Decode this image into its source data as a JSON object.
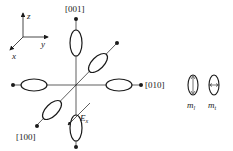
{
  "axes_glyph": {
    "z": "z",
    "y": "y",
    "x": "x"
  },
  "directions": {
    "top": "[001]",
    "right": "[010]",
    "diag": "[100]"
  },
  "field": {
    "label": "E",
    "subscript": "x"
  },
  "legend": [
    {
      "symbol": "m",
      "subscript": "l"
    },
    {
      "symbol": "m",
      "subscript": "t"
    }
  ],
  "colors": {
    "stroke": "#1a1a1a",
    "background": "#ffffff"
  }
}
